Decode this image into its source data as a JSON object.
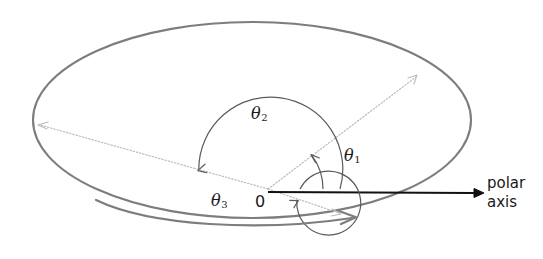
{
  "figure": {
    "background_color": "#ffffff",
    "width": 543,
    "height": 259
  },
  "colors": {
    "ellipse_stroke": "#7d7d7d",
    "sweep_arrow": "#7d7d7d",
    "arc_stroke": "#555555",
    "dotted_ray": "#b9b9b9",
    "polar_axis": "#111111",
    "text": "#1a1a1a"
  },
  "labels": {
    "theta1": {
      "symbol": "θ",
      "subscript": "1"
    },
    "theta2": {
      "symbol": "θ",
      "subscript": "2"
    },
    "theta3": {
      "symbol": "θ",
      "subscript": "3"
    },
    "origin": "0",
    "polar_axis_line1": "polar",
    "polar_axis_line2": "axis"
  },
  "geometry": {
    "origin": {
      "x": 268,
      "y": 189
    },
    "ellipse": {
      "cx": 252,
      "cy": 120,
      "rx": 219,
      "ry": 98
    },
    "polar_axis": {
      "from_x": 268,
      "from_y": 192,
      "to_x": 483,
      "to_y": 193
    },
    "rays": [
      {
        "name": "theta1-ray",
        "to_x": 418,
        "to_y": 75
      },
      {
        "name": "theta2-ray",
        "to_x": 38,
        "to_y": 124
      },
      {
        "name": "theta3-ray",
        "to_x": 341,
        "to_y": 214
      }
    ],
    "arcs": [
      {
        "name": "theta1-arc",
        "radius": 55,
        "direction": "counterclockwise"
      },
      {
        "name": "theta2-arc",
        "radius": 72,
        "direction": "counterclockwise"
      },
      {
        "name": "theta3-arc",
        "radius": 32,
        "direction": "clockwise"
      }
    ]
  }
}
